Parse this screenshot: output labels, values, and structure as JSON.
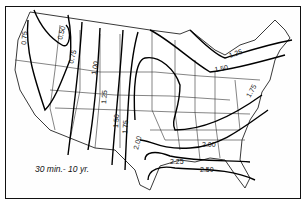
{
  "map": {
    "title": "30 min.- 10 yr.",
    "region": "Contiguous United States",
    "isolines": [
      {
        "value": "0.50",
        "label_pos": [
          62,
          40
        ],
        "rotate": -75
      },
      {
        "value": "0.75",
        "label_pos": [
          26,
          45
        ],
        "rotate": -85
      },
      {
        "value": "0.75",
        "label_pos": [
          73,
          64
        ],
        "rotate": -75
      },
      {
        "value": "1.00",
        "label_pos": [
          96,
          75
        ],
        "rotate": -80
      },
      {
        "value": "1.25",
        "label_pos": [
          106,
          104
        ],
        "rotate": -85
      },
      {
        "value": "1.25",
        "label_pos": [
          230,
          58
        ],
        "rotate": -20
      },
      {
        "value": "1.50",
        "label_pos": [
          118,
          128
        ],
        "rotate": -85
      },
      {
        "value": "1.50",
        "label_pos": [
          215,
          72
        ],
        "rotate": -10
      },
      {
        "value": "1.75",
        "label_pos": [
          127,
          134
        ],
        "rotate": -85
      },
      {
        "value": "1.75",
        "label_pos": [
          250,
          98
        ],
        "rotate": -60
      },
      {
        "value": "2.00",
        "label_pos": [
          138,
          145
        ],
        "rotate": -75
      },
      {
        "value": "2.00",
        "label_pos": [
          210,
          143
        ],
        "rotate": -5
      },
      {
        "value": "2.25",
        "label_pos": [
          180,
          163
        ],
        "rotate": 0
      },
      {
        "value": "2.50",
        "label_pos": [
          207,
          171
        ],
        "rotate": 0
      }
    ]
  }
}
